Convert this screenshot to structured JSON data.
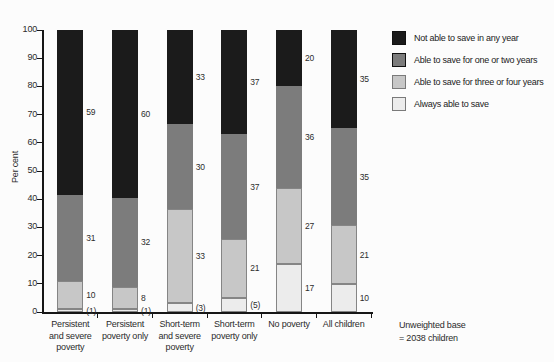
{
  "chart_data": {
    "type": "bar",
    "stacked": true,
    "title": "",
    "ylabel": "Per cent",
    "xlabel": "",
    "ylim": [
      0,
      100
    ],
    "ytick_step": 10,
    "grid": false,
    "legend_position": "top-right",
    "categories": [
      "Persistent\nand severe\npoverty",
      "Persistent\npoverty only",
      "Short-term\nand severe\npoverty",
      "Short-term\npoverty only",
      "No poverty",
      "All children"
    ],
    "series": [
      {
        "name": "Always able to save",
        "color": "#ececec",
        "values": [
          1,
          1,
          3,
          5,
          17,
          10
        ],
        "labels": [
          "(1)",
          "(1)",
          "(3)",
          "(5)",
          "17",
          "10"
        ]
      },
      {
        "name": "Able to save for three or four years",
        "color": "#c7c7c7",
        "values": [
          10,
          8,
          33,
          21,
          27,
          21
        ],
        "labels": [
          "10",
          "8",
          "33",
          "21",
          "27",
          "21"
        ]
      },
      {
        "name": "Able to save for one or two years",
        "color": "#7c7c7c",
        "values": [
          31,
          32,
          30,
          37,
          36,
          35
        ],
        "labels": [
          "31",
          "32",
          "30",
          "37",
          "36",
          "35"
        ]
      },
      {
        "name": "Not able to save in any year",
        "color": "#1b1b1b",
        "values": [
          59,
          60,
          33,
          37,
          20,
          35
        ],
        "labels": [
          "59",
          "60",
          "33",
          "37",
          "20",
          "35"
        ]
      }
    ],
    "legend": [
      {
        "label": "Not able to save in any year",
        "color": "#1b1b1b"
      },
      {
        "label": "Able to save for one or two years",
        "color": "#7c7c7c"
      },
      {
        "label": "Able to save for three or four years",
        "color": "#c7c7c7"
      },
      {
        "label": "Always able to save",
        "color": "#ececec"
      }
    ],
    "note": "Unweighted base\n= 2038 children"
  }
}
